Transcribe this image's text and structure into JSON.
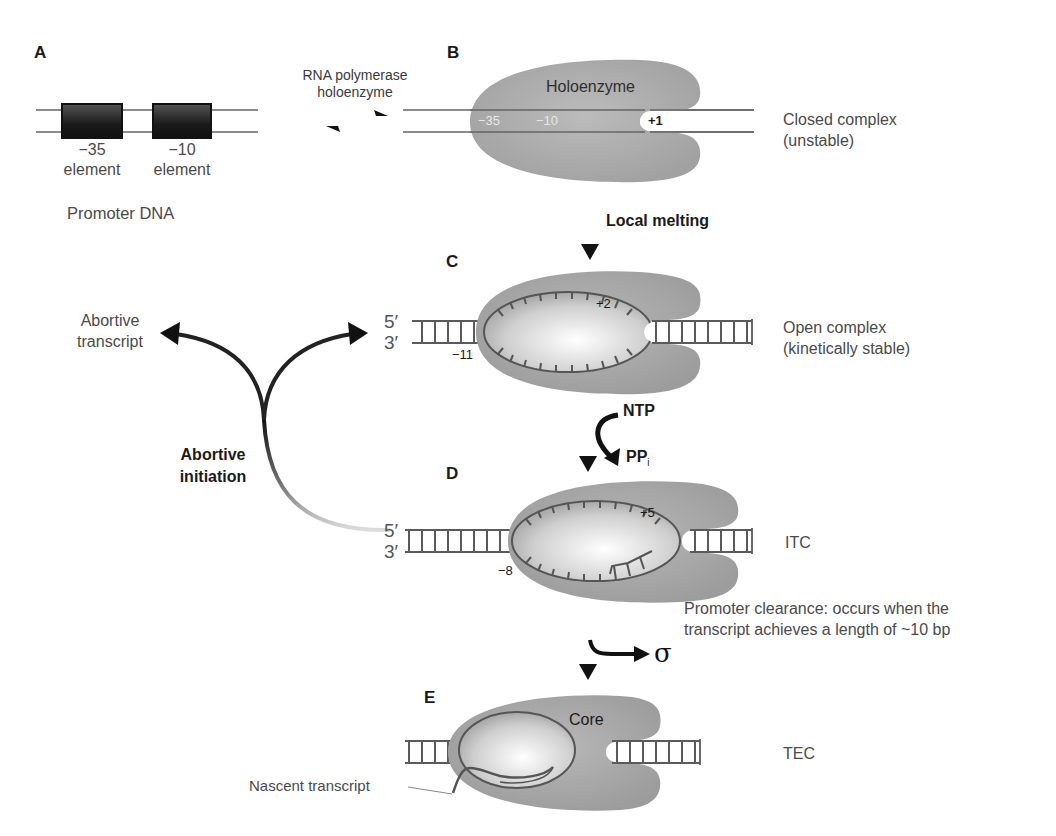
{
  "panels": {
    "a": {
      "letter": "A",
      "element_35_num": "−35",
      "element_35_word": "element",
      "element_10_num": "−10",
      "element_10_word": "element",
      "caption": "Promoter DNA"
    },
    "equilibrium": {
      "line1": "RNA polymerase",
      "line2": "holoenzyme"
    },
    "b": {
      "letter": "B",
      "enzyme_label": "Holoenzyme",
      "pos_35": "−35",
      "pos_10": "−10",
      "pos_plus1": "+1",
      "state_line1": "Closed complex",
      "state_line2": "(unstable)"
    },
    "step_bc": {
      "label": "Local melting"
    },
    "c": {
      "letter": "C",
      "five_prime": "5′",
      "three_prime": "3′",
      "pos_upstream": "−11",
      "pos_downstream": "+2",
      "state_line1": "Open complex",
      "state_line2": "(kinetically stable)"
    },
    "step_cd": {
      "substrate": "NTP",
      "product": "PP",
      "product_sub": "i"
    },
    "abortive": {
      "product_line1": "Abortive",
      "product_line2": "transcript",
      "process_line1": "Abortive",
      "process_line2": "initiation"
    },
    "d": {
      "letter": "D",
      "five_prime": "5′",
      "three_prime": "3′",
      "pos_upstream": "−8",
      "pos_downstream": "+5",
      "state": "ITC"
    },
    "step_de": {
      "line1": "Promoter clearance: occurs when the",
      "line2": "transcript achieves a length of ~10 bp",
      "released": "σ"
    },
    "e": {
      "letter": "E",
      "enzyme_label": "Core",
      "transcript_label": "Nascent transcript",
      "state": "TEC"
    }
  },
  "colors": {
    "enzyme": "#a9a9a9",
    "enzyme_dark": "#8e8e8e",
    "bubble_light": "#f2f2f2",
    "dna_line": "#5a5a5a",
    "arrow": "#111111",
    "promoter_box": "#1e1e1e"
  }
}
